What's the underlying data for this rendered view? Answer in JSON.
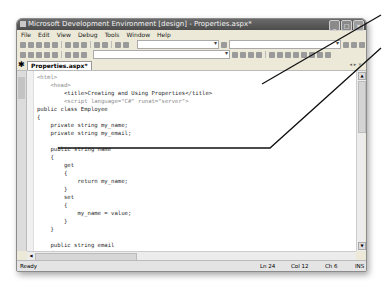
{
  "window": {
    "title": "Microsoft Development Environment [design] - Properties.aspx*",
    "controls": {
      "minimize": "_",
      "maximize": "□",
      "close": "×"
    }
  },
  "menubar": {
    "items": [
      {
        "label": "File"
      },
      {
        "label": "Edit"
      },
      {
        "label": "View"
      },
      {
        "label": "Debug"
      },
      {
        "label": "Tools"
      },
      {
        "label": "Window"
      },
      {
        "label": "Help"
      }
    ]
  },
  "tabs": {
    "toolbox_icon": "toolbox-icon",
    "document_tab": "Properties.aspx*",
    "controls": "◂ ▸ ×"
  },
  "code": {
    "lines": [
      "<html>",
      "    <head>",
      "        <title>Creating and Using Properties</title>",
      "        <script language=\"C#\" runat=\"server\">",
      "public class Employee",
      "{",
      "    private string my_name;",
      "    private string my_email;",
      "",
      "    public string name",
      "    {",
      "        get",
      "        {",
      "            return my_name;",
      "        }",
      "        set",
      "        {",
      "            my_name = value;",
      "        }",
      "    }",
      "",
      "    public string email",
      "    {",
      "        get",
      "        {",
      "            return my_email;"
    ]
  },
  "statusbar": {
    "status": "Ready",
    "line": "Ln 24",
    "col": "Col 12",
    "ch": "Ch 6",
    "mode": "INS"
  },
  "colors": {
    "titlebar": "#555555",
    "chrome": "#ece9d8",
    "editor_bg": "#ffffff",
    "callout_line": "#111111"
  }
}
